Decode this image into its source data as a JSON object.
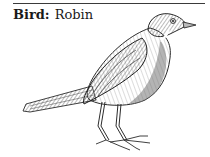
{
  "caption": {
    "label": "Bird:",
    "value": "Robin"
  },
  "illustration": {
    "subject": "robin",
    "style": "pencil-sketch",
    "ink_color": "#2b2b2b",
    "shade_color": "#6e6e6e",
    "light_color": "#b5b5b5"
  }
}
